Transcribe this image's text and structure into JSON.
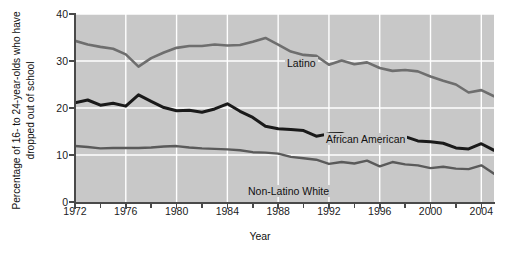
{
  "chart_data": {
    "type": "line",
    "title": "",
    "xlabel": "Year",
    "ylabel": "Percentage of 16- to 24-year-olds who have dropped out of school",
    "ylim": [
      0,
      40
    ],
    "xlim": [
      1972,
      2005
    ],
    "yticks": [
      0,
      10,
      20,
      30,
      40
    ],
    "xticks": [
      1972,
      1974,
      1976,
      1978,
      1980,
      1982,
      1984,
      1986,
      1988,
      1990,
      1992,
      1994,
      1996,
      1998,
      2000,
      2002,
      2004
    ],
    "xtick_labels": [
      "1972",
      "",
      "1976",
      "",
      "1980",
      "",
      "1984",
      "",
      "1988",
      "",
      "1992",
      "",
      "1996",
      "",
      "2000",
      "",
      "2004"
    ],
    "grid": true,
    "grid_color": "#ffffff",
    "plot_background": "#c8c8c8",
    "legend_position": "inline-annotations",
    "x": [
      1972,
      1973,
      1974,
      1975,
      1976,
      1977,
      1978,
      1979,
      1980,
      1981,
      1982,
      1983,
      1984,
      1985,
      1986,
      1987,
      1988,
      1989,
      1990,
      1991,
      1992,
      1993,
      1994,
      1995,
      1996,
      1997,
      1998,
      1999,
      2000,
      2001,
      2002,
      2003,
      2004,
      2005
    ],
    "series": [
      {
        "name": "Latino",
        "color": "#6e6e6e",
        "values": [
          34.3,
          33.5,
          33.0,
          32.6,
          31.4,
          28.8,
          30.6,
          31.8,
          32.8,
          33.2,
          33.2,
          33.5,
          33.3,
          33.4,
          34.1,
          34.9,
          33.5,
          32.0,
          31.3,
          31.1,
          29.2,
          30.1,
          29.3,
          29.7,
          28.5,
          27.9,
          28.1,
          27.8,
          26.7,
          25.8,
          25.0,
          23.3,
          23.8,
          22.5
        ]
      },
      {
        "name": "African American",
        "color": "#1a1a1a",
        "values": [
          21.1,
          21.7,
          20.6,
          21.0,
          20.4,
          22.8,
          21.4,
          20.1,
          19.4,
          19.5,
          19.1,
          19.8,
          20.9,
          19.3,
          18.0,
          16.1,
          15.6,
          15.4,
          15.2,
          14.0,
          14.5,
          14.6,
          13.6,
          13.5,
          13.2,
          13.2,
          13.9,
          13.0,
          12.8,
          12.5,
          11.5,
          11.3,
          12.4,
          11.0
        ]
      },
      {
        "name": "Non-Latino White",
        "color": "#5a5a5a",
        "values": [
          11.9,
          11.7,
          11.4,
          11.5,
          11.5,
          11.5,
          11.6,
          11.8,
          11.9,
          11.6,
          11.4,
          11.3,
          11.2,
          11.0,
          10.6,
          10.5,
          10.3,
          9.6,
          9.3,
          9.0,
          8.1,
          8.5,
          8.2,
          8.8,
          7.6,
          8.5,
          8.0,
          7.8,
          7.2,
          7.5,
          7.1,
          7.0,
          7.8,
          6.0
        ]
      }
    ],
    "annotations": [
      {
        "text": "Latino",
        "x": 1987,
        "y": 31
      },
      {
        "text": "African American",
        "x": 1991,
        "y": 17.5
      },
      {
        "text": "Non-Latino White",
        "x": 1980,
        "y": 6.5
      }
    ]
  }
}
